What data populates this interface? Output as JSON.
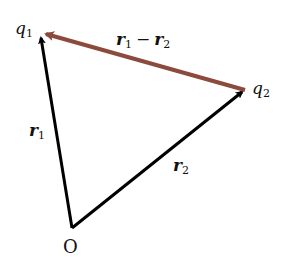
{
  "diagram": {
    "type": "vector-diagram",
    "points": {
      "origin": {
        "label": "O",
        "x": 72,
        "y": 228
      },
      "q1": {
        "label": "q",
        "sub": "1",
        "x": 40,
        "y": 32
      },
      "q2": {
        "label": "q",
        "sub": "2",
        "x": 245,
        "y": 90
      }
    },
    "vectors": [
      {
        "name": "r1",
        "label": "r",
        "sub": "1",
        "from": "origin",
        "to": "q1",
        "color": "#000000"
      },
      {
        "name": "r2",
        "label": "r",
        "sub": "2",
        "from": "origin",
        "to": "q2",
        "color": "#000000"
      },
      {
        "name": "r1-r2",
        "label_a": "r",
        "sub_a": "1",
        "op": "−",
        "label_b": "r",
        "sub_b": "2",
        "from": "q2",
        "to": "q1",
        "color": "#8B4A3C"
      }
    ]
  }
}
